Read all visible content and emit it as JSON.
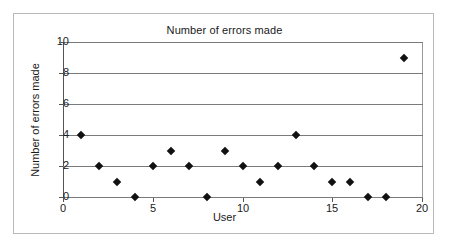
{
  "chart_data": {
    "type": "scatter",
    "title": "Number of errors made",
    "xlabel": "User",
    "ylabel": "Number of errors made",
    "xlim": [
      0,
      20
    ],
    "ylim": [
      0,
      10
    ],
    "grid": true,
    "legend": false,
    "marker": "diamond",
    "marker_color": "#111111",
    "gridline_color": "#7a7a7a",
    "x_ticks": [
      0,
      5,
      10,
      15,
      20
    ],
    "y_ticks": [
      0,
      2,
      4,
      6,
      8,
      10
    ],
    "x": [
      1,
      2,
      3,
      4,
      5,
      6,
      7,
      8,
      9,
      10,
      11,
      12,
      13,
      14,
      15,
      16,
      17,
      18,
      19
    ],
    "y": [
      4,
      2,
      1,
      0,
      2,
      3,
      2,
      0,
      3,
      2,
      1,
      2,
      4,
      2,
      1,
      1,
      0,
      0,
      9
    ],
    "points": [
      {
        "x": 1,
        "y": 4
      },
      {
        "x": 2,
        "y": 2
      },
      {
        "x": 3,
        "y": 1
      },
      {
        "x": 4,
        "y": 0
      },
      {
        "x": 5,
        "y": 2
      },
      {
        "x": 6,
        "y": 3
      },
      {
        "x": 7,
        "y": 2
      },
      {
        "x": 8,
        "y": 0
      },
      {
        "x": 9,
        "y": 3
      },
      {
        "x": 10,
        "y": 2
      },
      {
        "x": 11,
        "y": 1
      },
      {
        "x": 12,
        "y": 2
      },
      {
        "x": 13,
        "y": 4
      },
      {
        "x": 14,
        "y": 2
      },
      {
        "x": 15,
        "y": 1
      },
      {
        "x": 16,
        "y": 1
      },
      {
        "x": 17,
        "y": 0
      },
      {
        "x": 18,
        "y": 0
      },
      {
        "x": 19,
        "y": 9
      }
    ]
  }
}
